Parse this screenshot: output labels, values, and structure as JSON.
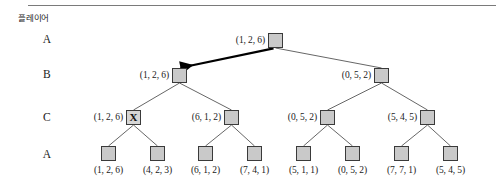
{
  "figure": {
    "kind": "game-tree",
    "width": 503,
    "height": 191,
    "background_color": "#ffffff",
    "node_fill_color": "#c9c9c9",
    "node_border_color": "#3a3a3a",
    "edge_color": "#555555",
    "highlight_edge_color": "#000000",
    "top_rule_color": "#7a7a7a"
  },
  "row_header": {
    "text": "플레이어"
  },
  "rows": [
    {
      "id": "row-a-top",
      "label": "A",
      "x": 47,
      "y": 40
    },
    {
      "id": "row-b",
      "label": "B",
      "x": 47,
      "y": 75
    },
    {
      "id": "row-c",
      "label": "C",
      "x": 47,
      "y": 118
    },
    {
      "id": "row-a-bottom",
      "label": "A",
      "x": 47,
      "y": 155
    }
  ],
  "nodes": [
    {
      "id": "root",
      "label": "(1, 2, 6)",
      "x": 268,
      "y": 33,
      "label_pos": "left",
      "marked": false
    },
    {
      "id": "b-left",
      "label": "(1, 2, 6)",
      "x": 172,
      "y": 68,
      "label_pos": "left",
      "marked": false
    },
    {
      "id": "b-right",
      "label": "(0, 5, 2)",
      "x": 374,
      "y": 68,
      "label_pos": "left",
      "marked": false
    },
    {
      "id": "c-1",
      "label": "(1, 2, 6)",
      "x": 126,
      "y": 110,
      "label_pos": "left",
      "marked": true,
      "mark_text": "X"
    },
    {
      "id": "c-2",
      "label": "(6, 1, 2)",
      "x": 224,
      "y": 110,
      "label_pos": "left",
      "marked": false
    },
    {
      "id": "c-3",
      "label": "(0, 5, 2)",
      "x": 320,
      "y": 110,
      "label_pos": "left",
      "marked": false
    },
    {
      "id": "c-4",
      "label": "(5, 4, 5)",
      "x": 420,
      "y": 110,
      "label_pos": "left",
      "marked": false
    },
    {
      "id": "leaf-1",
      "label": "(1, 2, 6)",
      "x": 101,
      "y": 146,
      "label_pos": "below",
      "marked": false
    },
    {
      "id": "leaf-2",
      "label": "(4, 2, 3)",
      "x": 150,
      "y": 146,
      "label_pos": "below",
      "marked": false
    },
    {
      "id": "leaf-3",
      "label": "(6, 1, 2)",
      "x": 198,
      "y": 146,
      "label_pos": "below",
      "marked": false
    },
    {
      "id": "leaf-4",
      "label": "(7, 4, 1)",
      "x": 247,
      "y": 146,
      "label_pos": "below",
      "marked": false
    },
    {
      "id": "leaf-5",
      "label": "(5, 1, 1)",
      "x": 296,
      "y": 146,
      "label_pos": "below",
      "marked": false
    },
    {
      "id": "leaf-6",
      "label": "(0, 5, 2)",
      "x": 345,
      "y": 146,
      "label_pos": "below",
      "marked": false
    },
    {
      "id": "leaf-7",
      "label": "(7, 7, 1)",
      "x": 394,
      "y": 146,
      "label_pos": "below",
      "marked": false
    },
    {
      "id": "leaf-8",
      "label": "(5, 4, 5)",
      "x": 443,
      "y": 146,
      "label_pos": "below",
      "marked": false
    }
  ],
  "edges": [
    {
      "from": "root",
      "to": "b-left",
      "style": "highlight-arrow"
    },
    {
      "from": "root",
      "to": "b-right",
      "style": "plain"
    },
    {
      "from": "b-left",
      "to": "c-1",
      "style": "plain"
    },
    {
      "from": "b-left",
      "to": "c-2",
      "style": "plain"
    },
    {
      "from": "b-right",
      "to": "c-3",
      "style": "plain"
    },
    {
      "from": "b-right",
      "to": "c-4",
      "style": "plain"
    },
    {
      "from": "c-1",
      "to": "leaf-1",
      "style": "plain"
    },
    {
      "from": "c-1",
      "to": "leaf-2",
      "style": "plain"
    },
    {
      "from": "c-2",
      "to": "leaf-3",
      "style": "plain"
    },
    {
      "from": "c-2",
      "to": "leaf-4",
      "style": "plain"
    },
    {
      "from": "c-3",
      "to": "leaf-5",
      "style": "plain"
    },
    {
      "from": "c-3",
      "to": "leaf-6",
      "style": "plain"
    },
    {
      "from": "c-4",
      "to": "leaf-7",
      "style": "plain"
    },
    {
      "from": "c-4",
      "to": "leaf-8",
      "style": "plain"
    }
  ]
}
